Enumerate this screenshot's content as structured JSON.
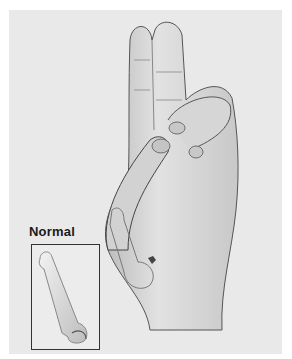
{
  "illustration": {
    "subject": "Hand with thumb touching index/middle fingertips; thumb metacarpal highlighted",
    "style": "grayscale medical illustration"
  },
  "inset": {
    "label": "Normal",
    "content": "normal thumb metacarpal bone"
  },
  "colors": {
    "background": "#ffffff",
    "panel": "#e9e9e9",
    "ink": "#1a1a1a"
  }
}
